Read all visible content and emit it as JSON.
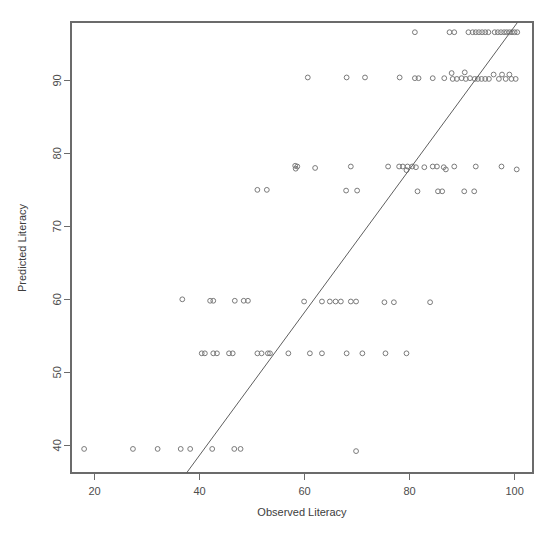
{
  "chart_data": {
    "type": "scatter",
    "title": "",
    "xlabel": "Observed Literacy",
    "ylabel": "Predicted Literacy",
    "xlim": [
      15.5,
      103.5
    ],
    "ylim": [
      36.2,
      98.0
    ],
    "xticks": [
      20,
      40,
      60,
      80,
      100
    ],
    "xtick_labels": [
      "20",
      "40",
      "60",
      "80",
      "100"
    ],
    "yticks": [
      40,
      50,
      60,
      70,
      80,
      90
    ],
    "ytick_labels": [
      "40",
      "50",
      "60",
      "70",
      "80",
      "90"
    ],
    "grid": false,
    "legend": null,
    "marker": "open-circle",
    "marker_color": "#7a7a7a",
    "box_color": "#6b6b6b",
    "reference_line": {
      "type": "identity-line",
      "color": "#5f5f5f",
      "x_start": 37.5,
      "y_start": 36.2,
      "x_end": 100.6,
      "y_end": 98.0
    },
    "series": [
      {
        "name": "Observed vs Predicted Literacy",
        "points": [
          [
            18.0,
            39.5
          ],
          [
            27.3,
            39.5
          ],
          [
            32.0,
            39.5
          ],
          [
            36.4,
            39.5
          ],
          [
            38.2,
            39.5
          ],
          [
            42.4,
            39.5
          ],
          [
            46.6,
            39.5
          ],
          [
            47.8,
            39.5
          ],
          [
            69.8,
            39.2
          ],
          [
            40.4,
            52.6
          ],
          [
            41.0,
            52.6
          ],
          [
            42.6,
            52.6
          ],
          [
            43.3,
            52.6
          ],
          [
            45.6,
            52.6
          ],
          [
            46.3,
            52.6
          ],
          [
            51.0,
            52.6
          ],
          [
            51.8,
            52.6
          ],
          [
            53.0,
            52.6
          ],
          [
            53.4,
            52.6
          ],
          [
            56.9,
            52.6
          ],
          [
            61.0,
            52.6
          ],
          [
            63.3,
            52.6
          ],
          [
            68.0,
            52.6
          ],
          [
            71.0,
            52.6
          ],
          [
            75.4,
            52.6
          ],
          [
            79.4,
            52.6
          ],
          [
            36.7,
            60.0
          ],
          [
            42.0,
            59.8
          ],
          [
            42.6,
            59.8
          ],
          [
            46.7,
            59.8
          ],
          [
            48.4,
            59.8
          ],
          [
            49.2,
            59.8
          ],
          [
            59.9,
            59.7
          ],
          [
            63.3,
            59.7
          ],
          [
            64.8,
            59.7
          ],
          [
            65.9,
            59.7
          ],
          [
            66.9,
            59.7
          ],
          [
            68.8,
            59.7
          ],
          [
            69.8,
            59.7
          ],
          [
            75.2,
            59.6
          ],
          [
            77.0,
            59.6
          ],
          [
            83.9,
            59.6
          ],
          [
            51.0,
            75.0
          ],
          [
            52.8,
            75.0
          ],
          [
            67.9,
            74.9
          ],
          [
            70.0,
            74.9
          ],
          [
            81.5,
            74.8
          ],
          [
            85.4,
            74.8
          ],
          [
            86.2,
            74.8
          ],
          [
            90.4,
            74.8
          ],
          [
            92.3,
            74.8
          ],
          [
            58.2,
            78.3
          ],
          [
            58.6,
            78.2
          ],
          [
            58.3,
            77.9
          ],
          [
            62.0,
            78.0
          ],
          [
            68.8,
            78.2
          ],
          [
            75.9,
            78.2
          ],
          [
            78.0,
            78.2
          ],
          [
            78.7,
            78.2
          ],
          [
            79.6,
            78.2
          ],
          [
            80.5,
            78.2
          ],
          [
            81.2,
            78.1
          ],
          [
            79.4,
            77.7
          ],
          [
            82.8,
            78.1
          ],
          [
            84.4,
            78.2
          ],
          [
            85.2,
            78.2
          ],
          [
            86.5,
            78.1
          ],
          [
            86.9,
            77.8
          ],
          [
            88.5,
            78.2
          ],
          [
            92.6,
            78.2
          ],
          [
            97.5,
            78.2
          ],
          [
            100.4,
            77.8
          ],
          [
            60.6,
            90.4
          ],
          [
            68.0,
            90.4
          ],
          [
            71.5,
            90.4
          ],
          [
            78.1,
            90.4
          ],
          [
            81.0,
            90.3
          ],
          [
            81.7,
            90.3
          ],
          [
            84.4,
            90.3
          ],
          [
            86.6,
            90.3
          ],
          [
            88.0,
            91.0
          ],
          [
            88.2,
            90.2
          ],
          [
            89.0,
            90.2
          ],
          [
            89.9,
            90.3
          ],
          [
            90.5,
            91.1
          ],
          [
            90.7,
            90.2
          ],
          [
            91.5,
            90.3
          ],
          [
            92.4,
            90.2
          ],
          [
            93.0,
            90.2
          ],
          [
            93.7,
            90.2
          ],
          [
            94.4,
            90.2
          ],
          [
            95.1,
            90.2
          ],
          [
            96.0,
            90.8
          ],
          [
            97.0,
            90.2
          ],
          [
            97.6,
            90.8
          ],
          [
            98.3,
            90.2
          ],
          [
            99.0,
            90.8
          ],
          [
            99.4,
            90.2
          ],
          [
            100.2,
            90.2
          ],
          [
            81.0,
            96.6
          ],
          [
            87.6,
            96.6
          ],
          [
            88.5,
            96.6
          ],
          [
            91.2,
            96.6
          ],
          [
            92.0,
            96.6
          ],
          [
            92.6,
            96.6
          ],
          [
            93.2,
            96.6
          ],
          [
            93.8,
            96.6
          ],
          [
            94.4,
            96.6
          ],
          [
            95.0,
            96.6
          ],
          [
            96.2,
            96.6
          ],
          [
            96.8,
            96.6
          ],
          [
            97.4,
            96.6
          ],
          [
            98.0,
            96.6
          ],
          [
            98.5,
            96.6
          ],
          [
            99.0,
            96.6
          ],
          [
            99.5,
            96.6
          ],
          [
            100.0,
            96.6
          ],
          [
            100.5,
            96.6
          ]
        ]
      }
    ]
  }
}
